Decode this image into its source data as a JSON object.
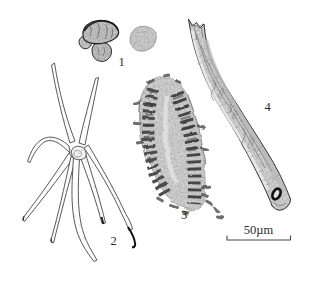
{
  "figure": {
    "specimens": [
      {
        "label": "1",
        "name": "granule-cluster"
      },
      {
        "label": "2",
        "name": "stellate-trichome"
      },
      {
        "label": "3",
        "name": "reticulate-vessel"
      },
      {
        "label": "4",
        "name": "fiber-fragment"
      }
    ],
    "scale_bar_label": "50µm"
  },
  "colors": {
    "background": "#ffffff",
    "ink": "#3b3b3b",
    "fill_light": "#d8d8d8"
  }
}
